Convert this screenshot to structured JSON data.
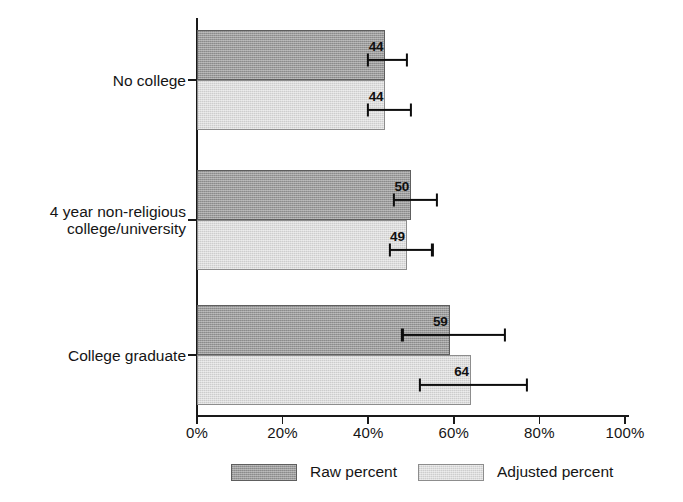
{
  "chart_data": {
    "type": "bar",
    "orientation": "horizontal",
    "title": "",
    "subtitle": "",
    "xlabel": "",
    "ylabel": "",
    "xlim": [
      0,
      100
    ],
    "xticks": [
      0,
      20,
      40,
      60,
      80,
      100
    ],
    "xticklabels": [
      "0%",
      "20%",
      "40%",
      "60%",
      "80%",
      "100%"
    ],
    "grid": false,
    "legend_position": "bottom",
    "categories": [
      "No college",
      "4 year non-religious\ncollege/university",
      "College graduate"
    ],
    "series": [
      {
        "name": "Raw percent",
        "color": "#9b9b9b",
        "values": [
          44,
          50,
          59
        ],
        "labels": [
          "44",
          "50",
          "59"
        ],
        "error_low": [
          40,
          46,
          48
        ],
        "error_high": [
          49,
          56,
          72
        ]
      },
      {
        "name": "Adjusted percent",
        "color": "#dcdcdc",
        "values": [
          44,
          49,
          64
        ],
        "labels": [
          "44",
          "49",
          "64"
        ],
        "error_low": [
          40,
          45,
          52
        ],
        "error_high": [
          50,
          55,
          77
        ]
      }
    ]
  },
  "legend": {
    "entries": [
      {
        "label": "Raw percent",
        "swatch": "raw"
      },
      {
        "label": "Adjusted percent",
        "swatch": "adjusted"
      }
    ]
  },
  "axis": {
    "x_tick_labels": [
      "0%",
      "20%",
      "40%",
      "60%",
      "80%",
      "100%"
    ],
    "y_category_labels": [
      "No college",
      "4 year non-religious\ncollege/university",
      "College graduate"
    ]
  }
}
